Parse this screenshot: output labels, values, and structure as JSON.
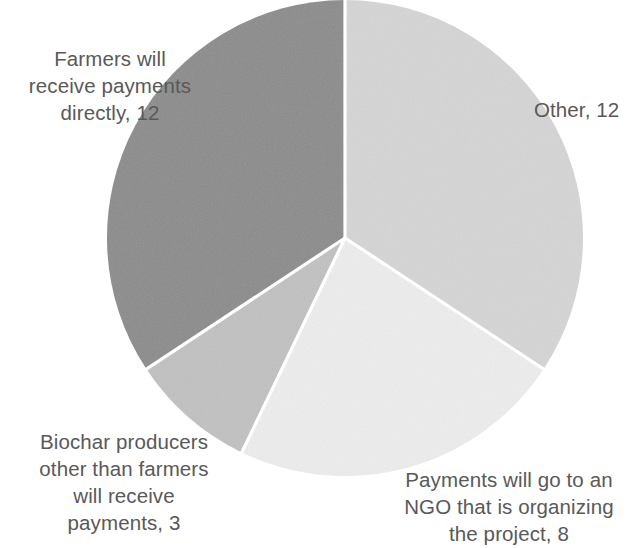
{
  "chart_data": {
    "type": "pie",
    "title": "",
    "subtitle": "",
    "xlabel": "",
    "ylabel": "",
    "total": 35,
    "legend_position": "none",
    "grid": false,
    "labels_show_value": true,
    "start_angle_deg": 0,
    "direction": "clockwise",
    "categories": [
      "Other",
      "Payments will go to an NGO that is organizing the project",
      "Biochar producers other than farmers will receive payments",
      "Farmers will receive payments directly"
    ],
    "values": [
      12,
      8,
      3,
      12
    ],
    "colors": [
      "#d5d5d5",
      "#ededed",
      "#c1c1c1",
      "#8b8b8b"
    ],
    "separator_color": "#ffffff",
    "label_color": "#595959",
    "background": "#ffffff",
    "geometry": {
      "center_x": 345,
      "center_y": 238,
      "radius": 238
    },
    "slices": [
      {
        "name": "Other",
        "value": 12,
        "percent": 34.3,
        "color": "#d5d5d5",
        "start_deg": 0,
        "end_deg": 123.4,
        "label_text": "Other, 12"
      },
      {
        "name": "Payments will go to an NGO that is organizing the project",
        "value": 8,
        "percent": 22.9,
        "color": "#ededed",
        "start_deg": 123.4,
        "end_deg": 205.7,
        "label_text": "Payments will go to an\nNGO that is organizing\nthe project, 8"
      },
      {
        "name": "Biochar producers other than farmers will receive payments",
        "value": 3,
        "percent": 8.6,
        "color": "#c1c1c1",
        "start_deg": 205.7,
        "end_deg": 236.6,
        "label_text": "Biochar producers\nother than farmers\nwill receive\npayments, 3"
      },
      {
        "name": "Farmers will receive payments directly",
        "value": 12,
        "percent": 34.3,
        "color": "#8b8b8b",
        "start_deg": 236.6,
        "end_deg": 360,
        "label_text": "Farmers will\nreceive payments\ndirectly, 12"
      }
    ]
  },
  "labels": {
    "farmers": "Farmers will\nreceive payments\ndirectly, 12",
    "other": "Other, 12",
    "biochar": "Biochar producers\nother than farmers\nwill receive\npayments, 3",
    "ngo": "Payments will go to an\nNGO that is organizing\nthe project, 8"
  }
}
